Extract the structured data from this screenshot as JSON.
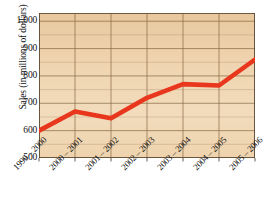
{
  "chart_data": {
    "type": "line",
    "title": "",
    "subtitle": "",
    "xlabel": "",
    "ylabel": "Sales (in millions of dollars)",
    "categories": [
      "1999 – 2000",
      "2000 – 2001",
      "2001 – 2002",
      "2002 – 2003",
      "2003 – 2004",
      "2004 – 2005",
      "2005 – 2006"
    ],
    "values": [
      600,
      670,
      645,
      720,
      770,
      765,
      860
    ],
    "ylim": [
      500,
      1030
    ],
    "y_ticks": [
      500,
      600,
      700,
      800,
      900,
      1000
    ],
    "y_tick_labels": [
      "500",
      "600",
      "700",
      "800",
      "900",
      "1,000"
    ],
    "y_minor_step": 50,
    "grid": true,
    "legend": "none",
    "series_name": "Sales",
    "line_color": "#e8371d",
    "plot_background": "#edd2a9",
    "grid_color": "#8c6a45"
  },
  "colors": {
    "line": "#e8371d",
    "plot_bg": "#edd2a9",
    "grid": "#8c6a45",
    "axis": "#5a4631",
    "text": "#111111",
    "page_bg": "#ffffff"
  }
}
